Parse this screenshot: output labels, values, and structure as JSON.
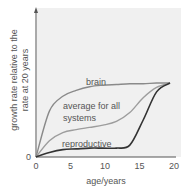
{
  "chart_data": {
    "type": "line",
    "title": "",
    "xlabel": "age/years",
    "ylabel": "growth rate relative to the rate at 20 years",
    "ylabel_lines": [
      "growth rate relative to the",
      "rate at 20 years"
    ],
    "xlim": [
      0,
      20
    ],
    "ylim": [
      0,
      1
    ],
    "x_ticks": [
      "0",
      "5",
      "10",
      "15",
      "20"
    ],
    "y_ticks": [
      "0"
    ],
    "grid": false,
    "legend": "inline labels",
    "x": [
      0,
      2,
      4,
      6,
      8,
      10,
      12,
      14,
      16,
      18,
      20
    ],
    "series": [
      {
        "name": "brain",
        "values": [
          0,
          0.62,
          0.82,
          0.9,
          0.95,
          0.97,
          0.98,
          0.99,
          0.99,
          1.0,
          1.0
        ],
        "color": "#8a8a8a"
      },
      {
        "name": "average for all systems",
        "values": [
          0,
          0.22,
          0.33,
          0.37,
          0.4,
          0.43,
          0.48,
          0.6,
          0.8,
          0.94,
          1.0
        ],
        "color": "#9a9a9a"
      },
      {
        "name": "reproductive",
        "values": [
          0,
          0.06,
          0.1,
          0.11,
          0.12,
          0.12,
          0.12,
          0.16,
          0.5,
          0.88,
          1.0
        ],
        "color": "#333333"
      }
    ]
  },
  "labels": {
    "origin": "0",
    "brain": "brain",
    "average_line1": "average for all",
    "average_line2": "systems",
    "reproductive": "reproductive"
  }
}
